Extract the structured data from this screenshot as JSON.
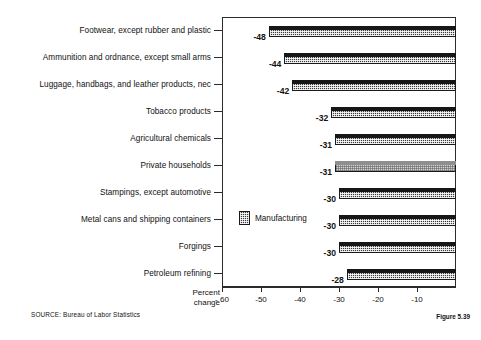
{
  "chart_data": {
    "type": "bar",
    "orientation": "horizontal",
    "title": "",
    "xlabel": "Percent change",
    "ylabel": "",
    "xlim": [
      -60,
      0
    ],
    "xticks": [
      -60,
      -50,
      -40,
      -30,
      -20,
      -10
    ],
    "xtick_labels": [
      "- 60",
      "-50",
      "-40",
      "-30",
      "-20",
      "-10"
    ],
    "grid": false,
    "legend": {
      "position": "inside-left-middle",
      "entries": [
        {
          "label": "Manufacturing",
          "swatch": "dark-hatch"
        }
      ]
    },
    "categories": [
      "Footwear, except rubber and plastic",
      "Ammunition and ordnance, except small arms",
      "Luggage, handbags, and leather products, nec",
      "Tobacco products",
      "Agricultural chemicals",
      "Private households",
      "Stampings, except automotive",
      "Metal cans and shipping containers",
      "Forgings",
      "Petroleum refining"
    ],
    "values": [
      -48,
      -44,
      -42,
      -32,
      -31,
      -31,
      -30,
      -30,
      -30,
      -28
    ],
    "value_labels": [
      "-48",
      "-44",
      "-42",
      "-32",
      "-31",
      "-31",
      "-30",
      "-30",
      "-30",
      "-28"
    ],
    "series_of": [
      "Manufacturing",
      "Manufacturing",
      "Manufacturing",
      "Manufacturing",
      "Manufacturing",
      "Other",
      "Manufacturing",
      "Manufacturing",
      "Manufacturing",
      "Manufacturing"
    ]
  },
  "axis": {
    "title_line1": "Percent",
    "title_line2": "change"
  },
  "footer": {
    "source": "SOURCE:  Bureau of Labor Statistics",
    "figure_number": "Figure 5.39"
  },
  "colors": {
    "bar_dark": "#3b3b3b",
    "bar_light": "#d2d2d2",
    "frame": "#2b2b2b",
    "text": "#111111",
    "background": "#ffffff"
  }
}
